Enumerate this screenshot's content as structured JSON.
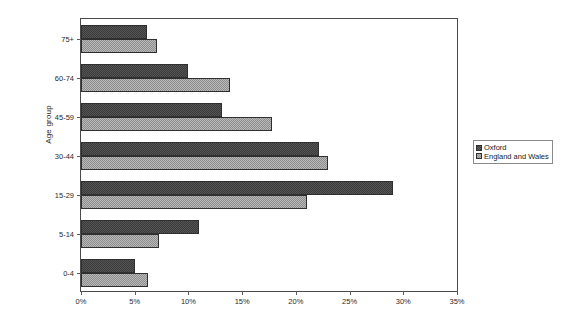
{
  "chart_data": {
    "type": "bar",
    "orientation": "horizontal",
    "title": "",
    "xlabel": "",
    "ylabel": "Age group",
    "xlim": [
      0,
      35
    ],
    "xtick_labels": [
      "0%",
      "5%",
      "10%",
      "15%",
      "20%",
      "25%",
      "30%",
      "35%"
    ],
    "xticks": [
      0,
      5,
      10,
      15,
      20,
      25,
      30,
      35
    ],
    "grid": false,
    "legend_position": "right",
    "categories": [
      "0-4",
      "5-14",
      "15-29",
      "30-44",
      "45-59",
      "60-74",
      "75+"
    ],
    "series": [
      {
        "name": "Oxford",
        "color": "#3a3a3a",
        "values": [
          5.0,
          11.0,
          29.0,
          22.2,
          13.1,
          10.0,
          6.1
        ]
      },
      {
        "name": "England and Wales",
        "color": "#b9b9b9",
        "values": [
          6.2,
          7.3,
          21.0,
          23.0,
          17.8,
          13.9,
          7.1
        ]
      }
    ]
  },
  "legend": {
    "items": [
      {
        "label": "Oxford"
      },
      {
        "label": "England and Wales"
      }
    ]
  }
}
